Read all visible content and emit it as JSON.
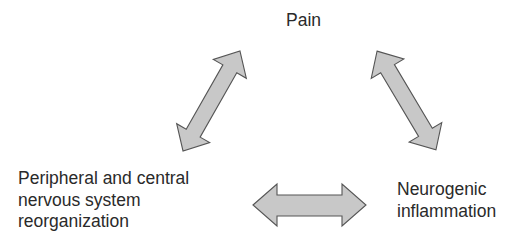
{
  "diagram": {
    "nodes": [
      {
        "id": "pain",
        "lines": [
          "Pain"
        ]
      },
      {
        "id": "reorganization",
        "lines": [
          "Peripheral and central",
          "nervous system",
          "reorganization"
        ]
      },
      {
        "id": "neurogenic",
        "lines": [
          "Neurogenic",
          "inflammation"
        ]
      }
    ],
    "edges": [
      {
        "from": "pain",
        "to": "reorganization",
        "type": "bidirectional"
      },
      {
        "from": "pain",
        "to": "neurogenic",
        "type": "bidirectional"
      },
      {
        "from": "reorganization",
        "to": "neurogenic",
        "type": "bidirectional"
      }
    ],
    "colors": {
      "arrow_fill": "#c8c8c8",
      "arrow_stroke": "#555555",
      "text": "#2a2a2a"
    }
  }
}
